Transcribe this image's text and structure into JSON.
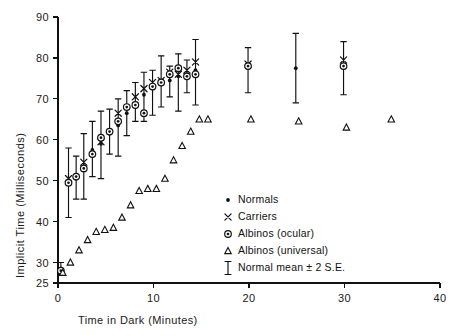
{
  "chart_data": {
    "type": "scatter",
    "title": "",
    "xlabel": "Time in Dark  (Minutes)",
    "ylabel": "Implicit Time (Milliseconds)",
    "xlim": [
      0,
      40
    ],
    "ylim": [
      25,
      90
    ],
    "xticks": [
      0,
      10,
      20,
      30,
      40
    ],
    "xtick_labels": [
      "0",
      "10",
      "20",
      "30",
      "40"
    ],
    "yticks": [
      25,
      30,
      40,
      50,
      60,
      70,
      80,
      90
    ],
    "ytick_labels": [
      "25",
      "30",
      "40",
      "50",
      "60",
      "70",
      "80",
      "90"
    ],
    "grid": false,
    "legend_position": "inside-lower-right",
    "series": [
      {
        "name": "Normals",
        "marker": "dot",
        "x": [
          0.3,
          1.1,
          1.9,
          2.7,
          3.6,
          4.5,
          5.4,
          6.3,
          7.2,
          8.1,
          9.0,
          9.9,
          10.8,
          11.7,
          12.6,
          13.5,
          14.4,
          19.9,
          24.9,
          29.9
        ],
        "y": [
          28.5,
          49.5,
          50.5,
          53.5,
          57.5,
          59.0,
          61.5,
          63.5,
          66.5,
          68.5,
          71.0,
          72.5,
          74.0,
          74.5,
          75.5,
          76.0,
          77.0,
          77.5,
          77.5,
          77.5
        ]
      },
      {
        "name": "Carriers",
        "marker": "cross",
        "x": [
          1.1,
          2.7,
          4.5,
          6.3,
          8.1,
          9.0,
          9.9,
          10.8,
          11.7,
          12.6,
          13.5,
          14.4,
          19.9,
          29.9
        ],
        "y": [
          50.5,
          54.5,
          59.5,
          66.5,
          70.5,
          72.5,
          74.0,
          74.5,
          76.5,
          76.0,
          77.0,
          79.0,
          78.5,
          79.5
        ]
      },
      {
        "name": "Albinos (ocular)",
        "marker": "dotcircle",
        "x": [
          0.3,
          1.1,
          1.9,
          2.7,
          3.6,
          4.5,
          5.4,
          6.3,
          7.2,
          8.1,
          9.0,
          9.9,
          10.8,
          11.7,
          12.6,
          13.5,
          14.4,
          19.9,
          29.9
        ],
        "y": [
          28.0,
          49.5,
          51.0,
          53.0,
          56.5,
          60.5,
          62.0,
          64.5,
          68.0,
          68.5,
          66.5,
          73.0,
          74.0,
          76.0,
          77.5,
          75.5,
          76.0,
          78.0,
          78.0
        ]
      },
      {
        "name": "Albinos (universal)",
        "marker": "triangle",
        "x": [
          0.5,
          1.3,
          2.2,
          3.1,
          4.0,
          4.9,
          5.8,
          6.7,
          7.6,
          8.5,
          9.4,
          10.3,
          11.2,
          12.1,
          13.0,
          13.9,
          14.8,
          15.7,
          20.2,
          25.2,
          30.2,
          34.9
        ],
        "y": [
          27.5,
          30.0,
          33.0,
          35.5,
          37.5,
          38.0,
          38.5,
          41.0,
          44.0,
          47.5,
          48.0,
          48.0,
          50.5,
          55.0,
          58.5,
          62.0,
          65.0,
          65.0,
          65.0,
          64.5,
          63.0,
          65.0
        ]
      }
    ],
    "errorbars": {
      "name": "Normal mean ± 2 S.E.",
      "x": [
        0.3,
        1.1,
        1.9,
        2.7,
        3.6,
        4.5,
        5.4,
        6.3,
        7.2,
        8.1,
        9.0,
        9.9,
        10.8,
        11.7,
        12.6,
        13.5,
        14.4,
        19.9,
        24.9,
        29.9
      ],
      "y": [
        28.5,
        49.5,
        50.5,
        53.5,
        57.5,
        59.0,
        61.5,
        63.5,
        66.5,
        68.5,
        71.0,
        72.5,
        74.0,
        74.5,
        75.5,
        76.0,
        77.0,
        77.5,
        77.5,
        77.5
      ],
      "lo": [
        27.0,
        41.0,
        45.5,
        45.5,
        51.0,
        50.5,
        56.5,
        56.0,
        61.0,
        64.5,
        64.5,
        66.0,
        68.0,
        70.5,
        67.0,
        71.5,
        68.5,
        71.5,
        69.0,
        71.0
      ],
      "hi": [
        30.0,
        58.0,
        56.0,
        61.5,
        64.5,
        67.0,
        67.5,
        70.0,
        72.0,
        74.0,
        76.5,
        77.0,
        80.5,
        78.0,
        81.0,
        79.5,
        84.5,
        82.5,
        86.0,
        84.0
      ]
    },
    "legend": [
      {
        "marker": "dot",
        "label": "Normals"
      },
      {
        "marker": "cross",
        "label": "Carriers"
      },
      {
        "marker": "dotcircle",
        "label": "Albinos (ocular)"
      },
      {
        "marker": "triangle",
        "label": "Albinos (universal)"
      },
      {
        "marker": "errorbar",
        "label": "Normal mean ± 2 S.E."
      }
    ]
  }
}
